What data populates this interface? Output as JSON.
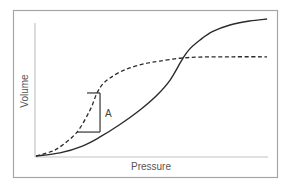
{
  "chart_data": {
    "type": "line",
    "title": "",
    "xlabel": "Pressure",
    "ylabel": "Volume",
    "xlim": [
      0,
      1
    ],
    "ylim": [
      0,
      1
    ],
    "grid": false,
    "legend": "none",
    "ticks": {
      "x": [],
      "y": []
    },
    "series": [
      {
        "name": "solid",
        "style": "solid",
        "color": "#2b2b2b",
        "points": [
          [
            0,
            0
          ],
          [
            0.103,
            0.023
          ],
          [
            0.2,
            0.075
          ],
          [
            0.276,
            0.143
          ],
          [
            0.36,
            0.235
          ],
          [
            0.448,
            0.346
          ],
          [
            0.52,
            0.455
          ],
          [
            0.578,
            0.571
          ],
          [
            0.629,
            0.722
          ],
          [
            0.66,
            0.8
          ],
          [
            0.707,
            0.872
          ],
          [
            0.76,
            0.935
          ],
          [
            0.836,
            0.985
          ],
          [
            0.92,
            1.015
          ],
          [
            0.996,
            1.03
          ]
        ]
      },
      {
        "name": "dashed",
        "style": "dashed",
        "color": "#2b2b2b",
        "points": [
          [
            0,
            0
          ],
          [
            0.06,
            0.03
          ],
          [
            0.103,
            0.068
          ],
          [
            0.177,
            0.18
          ],
          [
            0.233,
            0.346
          ],
          [
            0.263,
            0.474
          ],
          [
            0.29,
            0.545
          ],
          [
            0.319,
            0.586
          ],
          [
            0.36,
            0.63
          ],
          [
            0.405,
            0.662
          ],
          [
            0.47,
            0.695
          ],
          [
            0.534,
            0.714
          ],
          [
            0.62,
            0.735
          ],
          [
            0.707,
            0.744
          ],
          [
            0.85,
            0.746
          ],
          [
            0.996,
            0.746
          ]
        ]
      }
    ],
    "annotations": [
      {
        "type": "bracket",
        "label": "A",
        "x_top_start": 0.22,
        "x_bottom_start": 0.177,
        "x_right": 0.276,
        "y_top": 0.474,
        "y_bottom": 0.18
      }
    ]
  }
}
